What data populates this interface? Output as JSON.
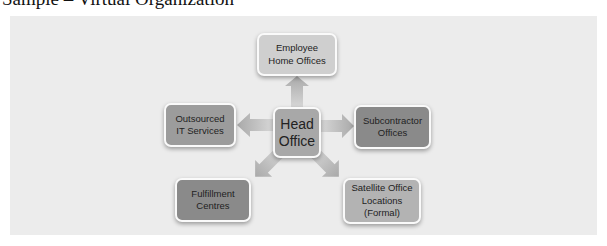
{
  "title": "Sample – Virtual Organization",
  "diagram": {
    "center": {
      "id": "head-office",
      "lines": [
        "Head",
        "Office"
      ]
    },
    "nodes": [
      {
        "id": "employee-home-offices",
        "lines": [
          "Employee",
          "Home Offices"
        ],
        "direction": "up"
      },
      {
        "id": "subcontractor-offices",
        "lines": [
          "Subcontractor",
          "Offices"
        ],
        "direction": "right"
      },
      {
        "id": "satellite-office-locations",
        "lines": [
          "Satellite Office",
          "Locations",
          "(Formal)"
        ],
        "direction": "down-right"
      },
      {
        "id": "fulfillment-centres",
        "lines": [
          "Fulfillment",
          "Centres"
        ],
        "direction": "down-left"
      },
      {
        "id": "outsourced-it-services",
        "lines": [
          "Outsourced",
          "IT Services"
        ],
        "direction": "left"
      }
    ],
    "colors": {
      "panel": "#ececec",
      "arrow": "#b8b8b8",
      "node_light": "#cfcfcf",
      "node_mid": "#9c9c9c",
      "node_dark": "#8a8a8a",
      "node_border": "#fafafa"
    }
  }
}
